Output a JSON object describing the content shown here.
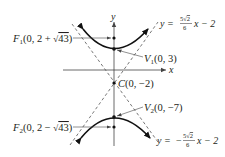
{
  "diagram": {
    "type": "hyperbola",
    "axes": {
      "x_label": "x",
      "y_label": "y"
    },
    "center": {
      "label_name": "C",
      "label_coords": "(0, −2)"
    },
    "vertices": [
      {
        "label_name": "V",
        "subscript": "1",
        "label_coords": "(0, 3)"
      },
      {
        "label_name": "V",
        "subscript": "2",
        "label_coords": "(0, −7)"
      }
    ],
    "foci": [
      {
        "label_name": "F",
        "subscript": "1",
        "label_pre": "(0, 2 + ",
        "radicand": "43",
        "label_post": ")"
      },
      {
        "label_name": "F",
        "subscript": "2",
        "label_pre": "(0, 2 − ",
        "radicand": "43",
        "label_post": ")"
      }
    ],
    "asymptotes": [
      {
        "lhs": "y = ",
        "sign": "",
        "num_coef": "5",
        "num_rad": "2",
        "den": "6",
        "rhs": "x − 2"
      },
      {
        "lhs": "y = ",
        "sign": "−",
        "num_coef": "5",
        "num_rad": "2",
        "den": "6",
        "rhs": "x − 2"
      }
    ],
    "colors": {
      "ink": "#231f20",
      "curve": "#111111",
      "dash": "#555555",
      "axis": "#444444"
    }
  }
}
